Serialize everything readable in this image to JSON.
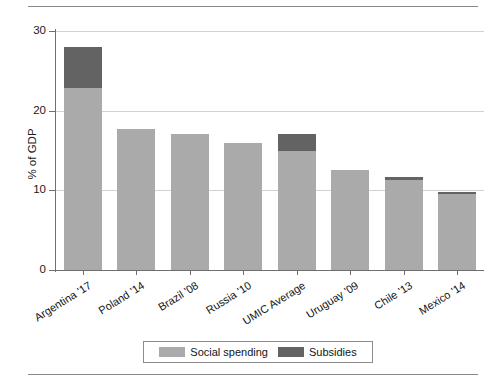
{
  "chart_data": {
    "type": "bar",
    "stacked": true,
    "title": "",
    "xlabel": "",
    "ylabel": "% of GDP",
    "ylim": [
      0,
      30
    ],
    "yticks": [
      0,
      10,
      20,
      30
    ],
    "ytick_labels": [
      "0",
      "10",
      "20",
      "30"
    ],
    "grid": true,
    "legend_position": "bottom",
    "categories": [
      "Argentina '17",
      "Poland '14",
      "Brazil '08",
      "Russia '10",
      "UMIC Average",
      "Uruguay '09",
      "Chile '13",
      "Mexico '14"
    ],
    "series": [
      {
        "name": "Social spending",
        "color": "#aaaaaa",
        "values": [
          22.8,
          17.7,
          17.1,
          15.9,
          14.9,
          12.5,
          11.3,
          9.5
        ]
      },
      {
        "name": "Subsidies",
        "color": "#636363",
        "values": [
          5.2,
          0.0,
          0.0,
          0.0,
          2.2,
          0.0,
          0.4,
          0.3
        ]
      }
    ],
    "totals": [
      28.0,
      17.7,
      17.1,
      15.9,
      17.1,
      12.5,
      11.7,
      9.8
    ]
  },
  "legend": {
    "entries": [
      {
        "label": "Social spending",
        "color": "#aaaaaa"
      },
      {
        "label": "Subsidies",
        "color": "#636363"
      }
    ]
  },
  "colors": {
    "social_spending": "#aaaaaa",
    "subsidies": "#636363",
    "axis": "#6f6f6f",
    "gridline": "#d2d2d2",
    "rule": "#8a8a8a",
    "background": "#ffffff"
  }
}
